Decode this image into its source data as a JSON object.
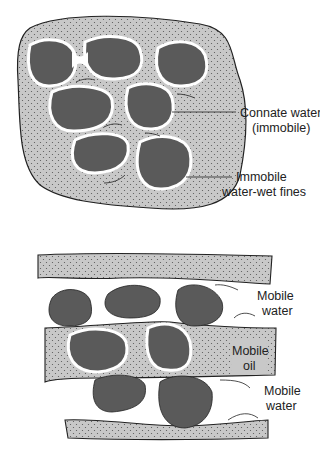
{
  "diagram": {
    "type": "pore-scale fluid distribution in sandstone",
    "panels": [
      {
        "id": "top",
        "description": "Oil-filled pore with water-wet grains",
        "labels": {
          "connate_water": [
            "Connate water",
            "(immobile)"
          ],
          "fines": [
            "Immobile",
            "water-wet fines"
          ]
        }
      },
      {
        "id": "bottom",
        "description": "Layered flow of mobile water and mobile oil",
        "labels": {
          "mobile_water_top": [
            "Mobile",
            "water"
          ],
          "mobile_oil": [
            "Mobile",
            "oil"
          ],
          "mobile_water_bottom": [
            "Mobile",
            "water"
          ]
        }
      }
    ],
    "colors": {
      "grain": "#5a5a5a",
      "oil": "#c8c8c8",
      "water_film": "#ffffff",
      "outline": "#222222",
      "background": "#ffffff"
    }
  }
}
